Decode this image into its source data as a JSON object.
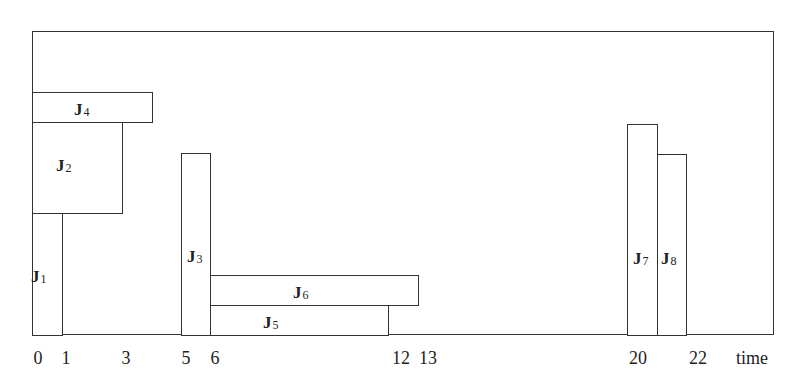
{
  "diagram": {
    "type": "schedule-gantt",
    "x_axis": {
      "title": "time",
      "ticks": [
        "0",
        "1",
        "3",
        "5",
        "6",
        "12",
        "13",
        "20",
        "22"
      ]
    },
    "jobs": [
      {
        "id": "J1",
        "name": "J",
        "sub": "1",
        "start": 0,
        "end": 1
      },
      {
        "id": "J2",
        "name": "J",
        "sub": "2",
        "start": 0,
        "end": 3
      },
      {
        "id": "J3",
        "name": "J",
        "sub": "3",
        "start": 5,
        "end": 6
      },
      {
        "id": "J4",
        "name": "J",
        "sub": "4",
        "start": 0,
        "end": 4
      },
      {
        "id": "J5",
        "name": "J",
        "sub": "5",
        "start": 6,
        "end": 12
      },
      {
        "id": "J6",
        "name": "J",
        "sub": "6",
        "start": 6,
        "end": 13
      },
      {
        "id": "J7",
        "name": "J",
        "sub": "7",
        "start": 20,
        "end": 21
      },
      {
        "id": "J8",
        "name": "J",
        "sub": "8",
        "start": 21,
        "end": 22
      }
    ],
    "colors": {
      "line": "#333333",
      "background": "#ffffff"
    }
  }
}
